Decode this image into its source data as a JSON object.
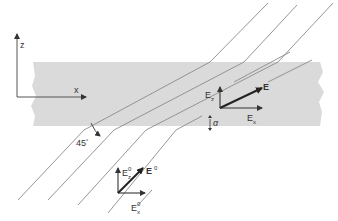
{
  "diagram": {
    "type": "refraction-through-slab",
    "colors": {
      "slab": "#d9d9d9",
      "ray": "#8a8a8a",
      "axis": "#444444",
      "vector": "#222222",
      "text": "#333333"
    },
    "axes": {
      "z_label": "z",
      "x_label": "x"
    },
    "incident": {
      "angle_label": "45",
      "angle_unit": "°",
      "field_label": "E",
      "field_superscript": "0",
      "ez_label": "E",
      "ez_sub": "z",
      "ez_sup": "0",
      "ex_label": "E",
      "ex_sub": "x",
      "ex_sup": "0"
    },
    "refracted": {
      "field_label": "E",
      "ez_label": "E",
      "ez_sub": "z",
      "ex_label": "E",
      "ex_sub": "x",
      "angle_label": "α"
    }
  }
}
